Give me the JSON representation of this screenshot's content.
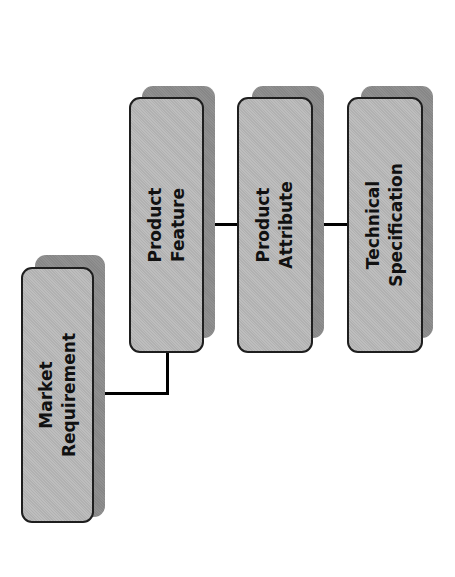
{
  "diagram": {
    "type": "hierarchy",
    "orientation": "rotated-90-ccw",
    "colors": {
      "background": "#ffffff",
      "box_fill": "#bababa",
      "box_border": "#1e1e1e",
      "shadow": "#8c8c8c",
      "connector": "#000000",
      "text": "#111111"
    },
    "nodes": {
      "market_requirement": {
        "line1": "Market",
        "line2": "Requirement"
      },
      "product_feature": {
        "line1": "Product",
        "line2": "Feature"
      },
      "product_attribute": {
        "line1": "Product",
        "line2": "Attribute"
      },
      "technical_specification": {
        "line1": "Technical",
        "line2": "Specification"
      }
    },
    "edges": [
      {
        "from": "Market Requirement",
        "to": "Product Feature"
      },
      {
        "from": "Product Feature",
        "to": "Product Attribute"
      },
      {
        "from": "Product Attribute",
        "to": "Technical Specification"
      }
    ]
  }
}
